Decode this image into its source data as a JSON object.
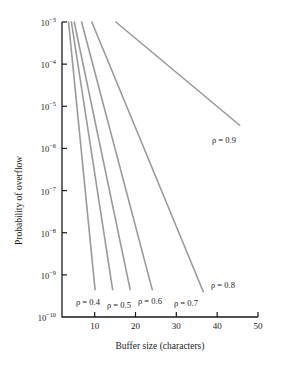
{
  "chart_data": {
    "type": "line",
    "title": "",
    "xlabel": "Buffer size (characters)",
    "ylabel": "Probability of overflow",
    "xlim": [
      2,
      50
    ],
    "ylim_exponents": [
      -10,
      -3
    ],
    "yscale": "log",
    "grid": false,
    "legend": "inline-annotations",
    "xticks": [
      10,
      20,
      30,
      40,
      50
    ],
    "xtick_labels": [
      "10",
      "20",
      "30",
      "40",
      "50"
    ],
    "ytick_labels": [
      {
        "mantissa": "10",
        "exponent": "−3"
      },
      {
        "mantissa": "10",
        "exponent": "−4"
      },
      {
        "mantissa": "10",
        "exponent": "−5"
      },
      {
        "mantissa": "10",
        "exponent": "−6"
      },
      {
        "mantissa": "10",
        "exponent": "−7"
      },
      {
        "mantissa": "10",
        "exponent": "−8"
      },
      {
        "mantissa": "10",
        "exponent": "−9"
      },
      {
        "mantissa": "10",
        "exponent": "−10"
      }
    ],
    "ytick_exponents": [
      -3,
      -4,
      -5,
      -6,
      -7,
      -8,
      -9,
      -10
    ],
    "line_color": "#9a9a9a",
    "axis_color": "#1a1a1a",
    "series": [
      {
        "name": "ρ = 0.4",
        "rho": 0.4,
        "label": "ρ = 0.4",
        "x": [
          3.6,
          10.1
        ],
        "y_exponents": [
          -3,
          -9.35
        ]
      },
      {
        "name": "ρ = 0.5",
        "rho": 0.5,
        "label": "ρ = 0.5",
        "x": [
          4.3,
          14.4
        ],
        "y_exponents": [
          -3,
          -9.35
        ]
      },
      {
        "name": "ρ = 0.6",
        "rho": 0.6,
        "label": "ρ = 0.6",
        "x": [
          5.0,
          18.7
        ],
        "y_exponents": [
          -3,
          -9.35
        ]
      },
      {
        "name": "ρ = 0.7",
        "rho": 0.7,
        "label": "ρ = 0.7",
        "x": [
          6.8,
          24.1
        ],
        "y_exponents": [
          -3,
          -9.35
        ]
      },
      {
        "name": "ρ = 0.8",
        "rho": 0.8,
        "label": "ρ = 0.8",
        "x": [
          9.3,
          36.6
        ],
        "y_exponents": [
          -3,
          -9.4
        ]
      },
      {
        "name": "ρ = 0.9",
        "rho": 0.9,
        "label": "ρ = 0.9",
        "x": [
          15.2,
          45.5
        ],
        "y_exponents": [
          -3,
          -5.45
        ]
      }
    ],
    "annotations": [
      {
        "text": "ρ = 0.4",
        "x_px": 76,
        "y_px": 298
      },
      {
        "text": "ρ = 0.5",
        "x_px": 107,
        "y_px": 301
      },
      {
        "text": "ρ = 0.6",
        "x_px": 138,
        "y_px": 297
      },
      {
        "text": "ρ = 0.7",
        "x_px": 174,
        "y_px": 299
      },
      {
        "text": "ρ = 0.8",
        "x_px": 211,
        "y_px": 281
      },
      {
        "text": "ρ = 0.9",
        "x_px": 212,
        "y_px": 136
      }
    ]
  }
}
